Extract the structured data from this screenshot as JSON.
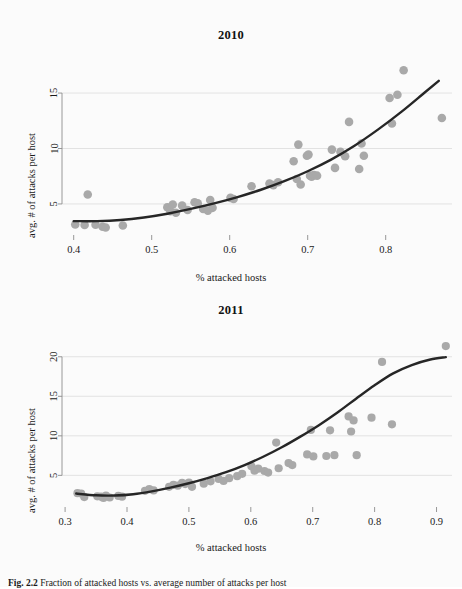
{
  "figure": {
    "caption_label": "Fig. 2.2",
    "caption_text": "Fraction of attacked hosts vs. average number of attacks per host",
    "background_color": "#fbfbfb",
    "point_color": "#a9a9a9",
    "curve_color": "#262626",
    "grid_color": "#dcdcdc",
    "axis_color": "#8c8c8c"
  },
  "chart_data": [
    {
      "type": "scatter",
      "title": "2010",
      "xlabel": "% attacked hosts",
      "ylabel": "avg. # of attacks per host",
      "xlim": [
        0.385,
        0.885
      ],
      "ylim": [
        2.2,
        17.8
      ],
      "xticks": [
        0.4,
        0.5,
        0.6,
        0.7,
        0.8
      ],
      "xticklabels": [
        "0.4",
        "0.5",
        "0.6",
        "0.7",
        "0.8"
      ],
      "yticks": [
        5,
        10,
        15
      ],
      "yticklabels": [
        "5",
        "10",
        "15"
      ],
      "grid": true,
      "grid_axis": "y",
      "legend": "none",
      "points": [
        [
          0.402,
          3.15
        ],
        [
          0.414,
          3.1
        ],
        [
          0.418,
          5.85
        ],
        [
          0.428,
          3.12
        ],
        [
          0.437,
          2.95
        ],
        [
          0.441,
          2.88
        ],
        [
          0.463,
          3.05
        ],
        [
          0.52,
          4.7
        ],
        [
          0.524,
          4.35
        ],
        [
          0.527,
          4.95
        ],
        [
          0.531,
          4.2
        ],
        [
          0.539,
          4.85
        ],
        [
          0.546,
          4.45
        ],
        [
          0.555,
          5.15
        ],
        [
          0.559,
          5.05
        ],
        [
          0.566,
          4.55
        ],
        [
          0.572,
          4.4
        ],
        [
          0.575,
          5.35
        ],
        [
          0.578,
          4.65
        ],
        [
          0.601,
          5.55
        ],
        [
          0.605,
          5.45
        ],
        [
          0.628,
          6.6
        ],
        [
          0.651,
          6.85
        ],
        [
          0.656,
          6.7
        ],
        [
          0.662,
          6.95
        ],
        [
          0.682,
          8.85
        ],
        [
          0.686,
          7.25
        ],
        [
          0.688,
          10.35
        ],
        [
          0.691,
          6.75
        ],
        [
          0.699,
          9.35
        ],
        [
          0.701,
          9.45
        ],
        [
          0.703,
          7.55
        ],
        [
          0.705,
          7.45
        ],
        [
          0.708,
          7.6
        ],
        [
          0.712,
          7.55
        ],
        [
          0.731,
          9.9
        ],
        [
          0.735,
          8.25
        ],
        [
          0.742,
          9.7
        ],
        [
          0.748,
          9.3
        ],
        [
          0.753,
          12.4
        ],
        [
          0.766,
          8.15
        ],
        [
          0.769,
          10.45
        ],
        [
          0.772,
          9.35
        ],
        [
          0.805,
          14.55
        ],
        [
          0.808,
          12.25
        ],
        [
          0.815,
          14.85
        ],
        [
          0.823,
          17.05
        ],
        [
          0.872,
          12.75
        ]
      ],
      "fit_curve": {
        "kind": "quadratic-trend",
        "points": [
          [
            0.4,
            3.45
          ],
          [
            0.43,
            3.45
          ],
          [
            0.46,
            3.55
          ],
          [
            0.49,
            3.78
          ],
          [
            0.52,
            4.12
          ],
          [
            0.55,
            4.55
          ],
          [
            0.58,
            5.05
          ],
          [
            0.61,
            5.62
          ],
          [
            0.64,
            6.28
          ],
          [
            0.67,
            7.05
          ],
          [
            0.7,
            7.95
          ],
          [
            0.73,
            9.0
          ],
          [
            0.76,
            10.25
          ],
          [
            0.79,
            11.7
          ],
          [
            0.82,
            13.3
          ],
          [
            0.85,
            15.05
          ],
          [
            0.868,
            16.1
          ]
        ]
      }
    },
    {
      "type": "scatter",
      "title": "2011",
      "xlabel": "% attacked hosts",
      "ylabel": "avg. # of attacks per host",
      "xlim": [
        0.295,
        0.925
      ],
      "ylim": [
        1.0,
        22.5
      ],
      "xticks": [
        0.3,
        0.4,
        0.5,
        0.6,
        0.7,
        0.8,
        0.9
      ],
      "xticklabels": [
        "0.3",
        "0.4",
        "0.5",
        "0.6",
        "0.7",
        "0.8",
        "0.9"
      ],
      "yticks": [
        5,
        10,
        15,
        20
      ],
      "yticklabels": [
        "5",
        "10",
        "15",
        "20"
      ],
      "grid": true,
      "grid_axis": "y",
      "legend": "none",
      "points": [
        [
          0.32,
          2.75
        ],
        [
          0.326,
          2.7
        ],
        [
          0.331,
          2.25
        ],
        [
          0.352,
          2.35
        ],
        [
          0.358,
          2.3
        ],
        [
          0.362,
          2.15
        ],
        [
          0.366,
          2.45
        ],
        [
          0.372,
          2.2
        ],
        [
          0.386,
          2.4
        ],
        [
          0.392,
          2.3
        ],
        [
          0.429,
          3.05
        ],
        [
          0.436,
          3.25
        ],
        [
          0.443,
          3.1
        ],
        [
          0.468,
          3.55
        ],
        [
          0.475,
          3.8
        ],
        [
          0.482,
          3.7
        ],
        [
          0.489,
          4.05
        ],
        [
          0.494,
          3.9
        ],
        [
          0.5,
          4.1
        ],
        [
          0.505,
          3.55
        ],
        [
          0.524,
          3.95
        ],
        [
          0.535,
          4.25
        ],
        [
          0.548,
          4.55
        ],
        [
          0.556,
          4.3
        ],
        [
          0.565,
          4.65
        ],
        [
          0.578,
          4.9
        ],
        [
          0.586,
          5.2
        ],
        [
          0.601,
          6.15
        ],
        [
          0.606,
          5.6
        ],
        [
          0.612,
          5.85
        ],
        [
          0.622,
          5.55
        ],
        [
          0.628,
          5.35
        ],
        [
          0.641,
          9.15
        ],
        [
          0.645,
          5.9
        ],
        [
          0.661,
          6.55
        ],
        [
          0.667,
          6.3
        ],
        [
          0.691,
          7.65
        ],
        [
          0.697,
          10.75
        ],
        [
          0.701,
          7.4
        ],
        [
          0.722,
          7.45
        ],
        [
          0.728,
          10.7
        ],
        [
          0.735,
          7.55
        ],
        [
          0.758,
          12.45
        ],
        [
          0.762,
          10.55
        ],
        [
          0.766,
          11.95
        ],
        [
          0.771,
          7.55
        ],
        [
          0.795,
          12.3
        ],
        [
          0.812,
          19.35
        ],
        [
          0.828,
          11.45
        ],
        [
          0.915,
          21.35
        ]
      ],
      "fit_curve": {
        "kind": "quadratic-trend",
        "points": [
          [
            0.318,
            2.7
          ],
          [
            0.35,
            2.48
          ],
          [
            0.38,
            2.45
          ],
          [
            0.41,
            2.62
          ],
          [
            0.44,
            2.98
          ],
          [
            0.47,
            3.45
          ],
          [
            0.5,
            4.0
          ],
          [
            0.53,
            4.65
          ],
          [
            0.56,
            5.4
          ],
          [
            0.59,
            6.3
          ],
          [
            0.62,
            7.35
          ],
          [
            0.65,
            8.55
          ],
          [
            0.68,
            9.9
          ],
          [
            0.71,
            11.35
          ],
          [
            0.74,
            12.95
          ],
          [
            0.77,
            14.7
          ],
          [
            0.8,
            16.4
          ],
          [
            0.83,
            17.9
          ],
          [
            0.86,
            18.95
          ],
          [
            0.89,
            19.65
          ],
          [
            0.915,
            19.95
          ]
        ]
      }
    }
  ]
}
